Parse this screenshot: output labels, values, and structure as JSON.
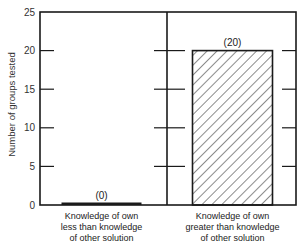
{
  "chart_data": {
    "type": "bar",
    "title": "",
    "xlabel": "",
    "ylabel": "Number of groups tested",
    "ylim": [
      0,
      25
    ],
    "yticks": [
      0,
      5,
      10,
      15,
      20,
      25
    ],
    "grid": false,
    "legend": null,
    "categories": [
      "Knowledge of own less than knowledge of other solution",
      "Knowledge of own greater than knowledge of other solution"
    ],
    "category_lines": [
      [
        "Knowledge of own",
        "less than knowledge",
        "of other solution"
      ],
      [
        "Knowledge of own",
        "greater than knowledge",
        "of other solution"
      ]
    ],
    "values": [
      0,
      20
    ],
    "value_labels": [
      "(0)",
      "(20)"
    ],
    "bar_styles": [
      "solid-line",
      "diagonal-hatch"
    ]
  },
  "colors": {
    "ink": "#1a1a1a",
    "background": "#ffffff"
  }
}
